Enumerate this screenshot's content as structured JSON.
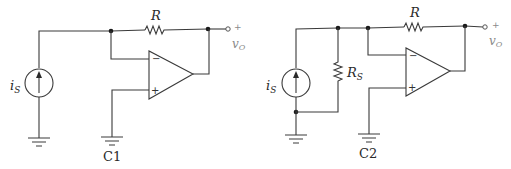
{
  "circuits": [
    {
      "id": "C1",
      "caption": "C1",
      "source_label": "i",
      "source_sub": "S",
      "feedback_resistor": "R",
      "output_plus": "+",
      "output_label": "v",
      "output_sub": "O",
      "opamp_minus": "−",
      "opamp_plus": "+"
    },
    {
      "id": "C2",
      "caption": "C2",
      "source_label": "i",
      "source_sub": "S",
      "source_resistor": "R",
      "source_resistor_sub": "S",
      "feedback_resistor": "R",
      "output_plus": "+",
      "output_label": "v",
      "output_sub": "O",
      "opamp_minus": "−",
      "opamp_plus": "+"
    }
  ],
  "colors": {
    "wire": "#3a3a3a",
    "background": "#ffffff",
    "output_label": "#8a8a8a"
  }
}
